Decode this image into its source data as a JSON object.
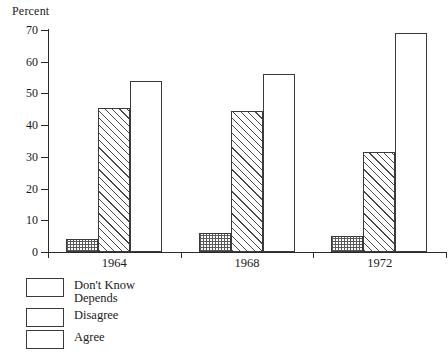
{
  "chart_data": {
    "type": "bar",
    "title": "",
    "subtitle": "",
    "xlabel": "",
    "ylabel": "Percent",
    "ylim": [
      0,
      70
    ],
    "yticks": [
      0,
      10,
      20,
      30,
      40,
      50,
      60,
      70
    ],
    "ytick_labels": [
      "0",
      "10",
      "20",
      "30",
      "40",
      "50",
      "60",
      "70"
    ],
    "grid": false,
    "legend_position": "below-left",
    "categories": [
      "1964",
      "1968",
      "1972"
    ],
    "series": [
      {
        "name": "Don't Know Depends",
        "values": [
          4,
          6,
          5
        ],
        "fill": "stipple"
      },
      {
        "name": "Disagree",
        "values": [
          45.5,
          44.5,
          31.5
        ],
        "fill": "hatch"
      },
      {
        "name": "Agree",
        "values": [
          54,
          56,
          69
        ],
        "fill": "white"
      }
    ],
    "annotations": []
  },
  "axis": {
    "y_title": "Percent"
  },
  "legend": {
    "items": [
      {
        "label_line1": "Don't Know",
        "label_line2": "Depends",
        "swatch": "stipple-swatch"
      },
      {
        "label_line1": "Disagree",
        "label_line2": "",
        "swatch": "hatch-swatch"
      },
      {
        "label_line1": "Agree",
        "label_line2": "",
        "swatch": "white-swatch"
      }
    ]
  },
  "colors": {
    "axis": "#2b2b2b",
    "bar_outline": "#3a3a3a",
    "hatch": "#4a4a4a",
    "stipple": "#5a5a5a",
    "background": "#ffffff"
  }
}
